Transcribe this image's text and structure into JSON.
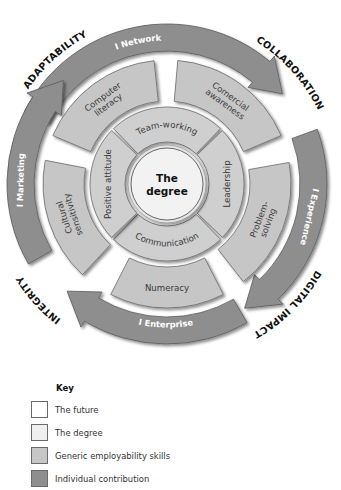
{
  "diagram": {
    "center": {
      "x": 167,
      "y": 184
    },
    "core": {
      "label_line1": "The",
      "label_line2": "degree",
      "radius": 36
    },
    "inner_ring": {
      "r_inner": 42,
      "r_outer": 77,
      "segments": [
        {
          "label": "Team-working",
          "start": -134,
          "end": -46
        },
        {
          "label": "Leadership",
          "start": -44,
          "end": 44
        },
        {
          "label": "Communication",
          "start": 46,
          "end": 134
        },
        {
          "label": "Positive attitude",
          "start": 136,
          "end": 224
        }
      ]
    },
    "middle_ring": {
      "r_inner": 83,
      "r_outer": 124,
      "segments": [
        {
          "label_lines": [
            "Computer",
            "literacy"
          ],
          "start": 203,
          "end": 264
        },
        {
          "label_lines": [
            "Comercial",
            "awareness"
          ],
          "start": 275,
          "end": 337
        },
        {
          "label_lines": [
            "Problem-",
            "solving"
          ],
          "start": 350,
          "end": 412
        },
        {
          "label_lines": [
            "Numeracy"
          ],
          "start": 63,
          "end": 117
        },
        {
          "label_lines": [
            "Cultural",
            "sensitivity"
          ],
          "start": 133,
          "end": 191
        }
      ]
    },
    "arrow_ring": {
      "r_inner": 133,
      "r_outer": 160,
      "arrows": [
        {
          "label": "I Network",
          "start": 207,
          "end": 322
        },
        {
          "label": "I Experience",
          "start": 340,
          "end": 418
        },
        {
          "label": "I Enterprise",
          "start": 60,
          "end": 133
        },
        {
          "label": "I Marketing",
          "start": 150,
          "end": 225
        }
      ]
    },
    "outer_labels": [
      {
        "label": "ADAPTABILITY",
        "angle": 228
      },
      {
        "label": "COLLABORATION",
        "angle": 318
      },
      {
        "label": "DIGITAL IMPACT",
        "angle": 45
      },
      {
        "label": "INTEGRITY",
        "angle": 138
      }
    ],
    "colors": {
      "the_future": "#ffffff",
      "the_degree": "#efefef",
      "generic_employability_skills": "#c6c6c6",
      "individual_contribution": "#8e8e8e"
    }
  },
  "key": {
    "title": "Key",
    "items": [
      {
        "label": "The future",
        "color": "#ffffff"
      },
      {
        "label": "The degree",
        "color": "#efefef"
      },
      {
        "label": "Generic employability skills",
        "color": "#c6c6c6"
      },
      {
        "label": "Individual contribution",
        "color": "#8e8e8e"
      }
    ]
  }
}
